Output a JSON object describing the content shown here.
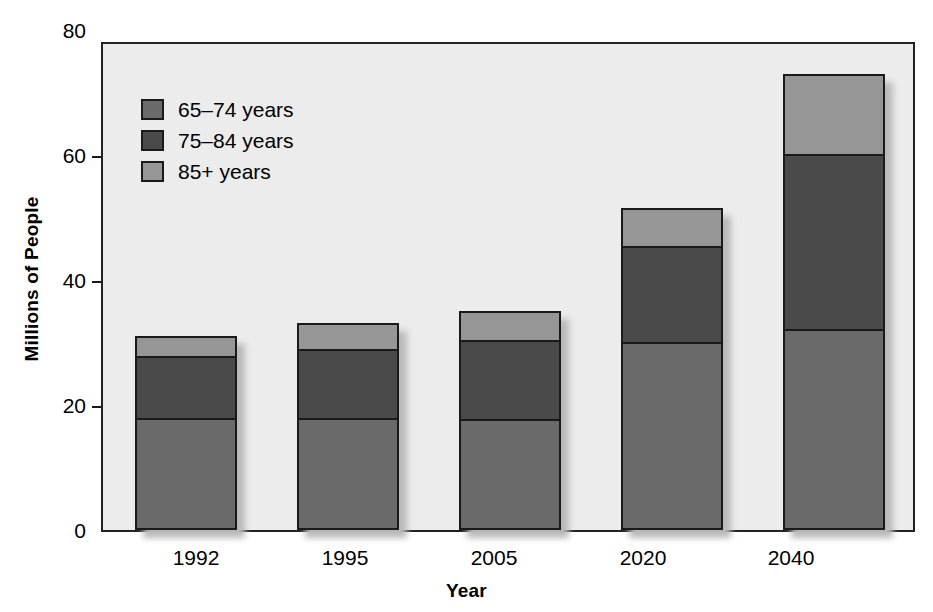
{
  "chart_data": {
    "type": "bar",
    "subtype": "stacked-bar",
    "title": "",
    "xlabel": "Year",
    "ylabel": "Millions of People",
    "categories": [
      "1992",
      "1995",
      "2005",
      "2020",
      "2040"
    ],
    "ylim": [
      0,
      80
    ],
    "yticks": [
      0,
      20,
      40,
      60,
      80
    ],
    "ytick_labels": [
      "0",
      "20",
      "40",
      "60",
      "80"
    ],
    "grid": false,
    "legend_position": "upper-left-inside",
    "series": [
      {
        "name": "65–74 years",
        "color": "#6a6a6a",
        "values": [
          18.5,
          18.5,
          18.3,
          31.0,
          33.0
        ]
      },
      {
        "name": "75–84 years",
        "color": "#4a4a4a",
        "values": [
          10.5,
          11.5,
          13.2,
          16.0,
          29.0
        ]
      },
      {
        "name": "85+ years",
        "color": "#969696",
        "values": [
          3.0,
          4.0,
          4.5,
          6.0,
          13.0
        ]
      }
    ],
    "totals": [
      32.0,
      34.0,
      36.0,
      53.0,
      75.0
    ]
  },
  "axes": {
    "y_title": "Millions of People",
    "x_title": "Year",
    "y_tick_labels": [
      "80",
      "60",
      "40",
      "20",
      "0"
    ],
    "x_tick_labels": [
      "1992",
      "1995",
      "2005",
      "2020",
      "2040"
    ]
  },
  "legend": {
    "items": [
      {
        "label": "65–74 years",
        "color": "#6a6a6a"
      },
      {
        "label": "75–84 years",
        "color": "#4a4a4a"
      },
      {
        "label": "85+ years",
        "color": "#969696"
      }
    ]
  },
  "colors": {
    "plot_background": "#ececec",
    "page_background": "#ffffff",
    "axis_line": "#222222",
    "bar_outline": "#1a1a1a",
    "shadow": "#b9b9b9"
  }
}
